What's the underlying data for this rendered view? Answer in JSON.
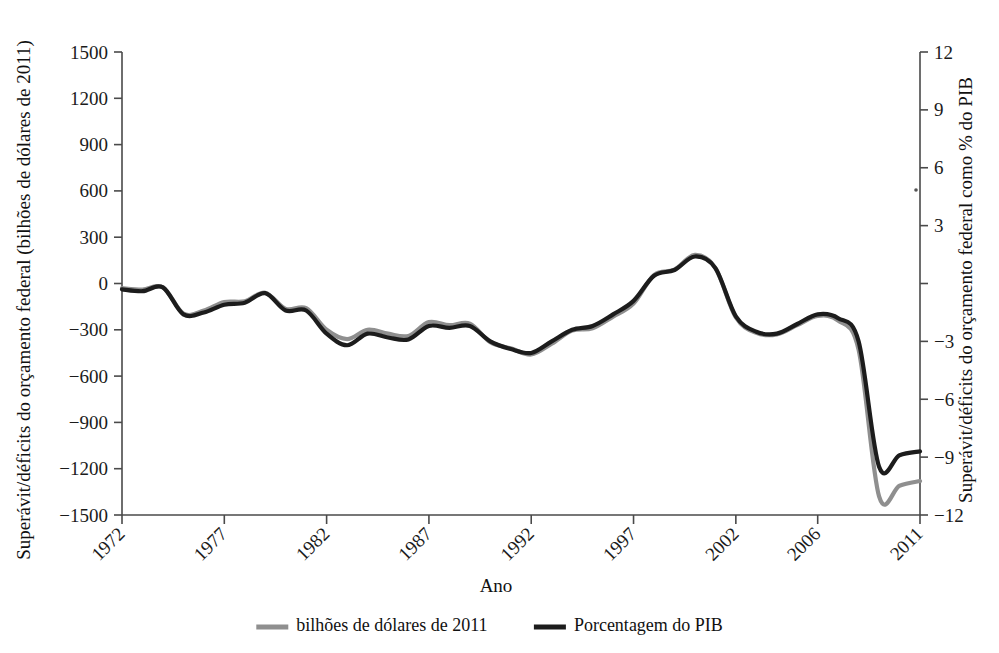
{
  "chart_data": {
    "type": "line",
    "title": "",
    "xlabel": "Ano",
    "ylabel_left": "Superávit/déficits do orçamento federal (bilhões de dólares de 2011)",
    "ylabel_right": "Superávit/déficits do orçamento federal como % do PIB",
    "xlim": [
      1972,
      2011
    ],
    "ylim_left": [
      -1500,
      1500
    ],
    "ylim_right": [
      -12,
      12
    ],
    "xticks": [
      1972,
      1977,
      1982,
      1987,
      1992,
      1997,
      2002,
      2006,
      2011
    ],
    "xticklabels": [
      "1972",
      "1977",
      "1982",
      "1987",
      "1992",
      "1997",
      "2002",
      "2006",
      "2011"
    ],
    "yticks_left": [
      1500,
      1200,
      900,
      600,
      300,
      0,
      -300,
      -600,
      -900,
      -1200,
      -1500
    ],
    "yticklabels_left": [
      "1500",
      "1200",
      "900",
      "600",
      "300",
      "0",
      "−300",
      "−600",
      "−900",
      "−1200",
      "−1500"
    ],
    "yticks_right": [
      12,
      9,
      6,
      3,
      0,
      -3,
      -6,
      -9,
      -12
    ],
    "yticklabels_right": [
      "12",
      "9",
      "6",
      "3",
      "",
      "−3",
      "−6",
      "−9",
      "−12"
    ],
    "grid": false,
    "legend_position": "bottom",
    "x": [
      1972,
      1973,
      1974,
      1975,
      1976,
      1977,
      1978,
      1979,
      1980,
      1981,
      1982,
      1983,
      1984,
      1985,
      1986,
      1987,
      1988,
      1989,
      1990,
      1991,
      1992,
      1993,
      1994,
      1995,
      1996,
      1997,
      1998,
      1999,
      2000,
      2001,
      2002,
      2003,
      2004,
      2005,
      2006,
      2007,
      2008,
      2009,
      2010,
      2011
    ],
    "series": [
      {
        "name": "bilhões de dólares de 2011",
        "axis": "left",
        "color": "#8f8f8f",
        "values": [
          -30,
          -40,
          -25,
          -195,
          -175,
          -120,
          -115,
          -60,
          -165,
          -160,
          -300,
          -360,
          -300,
          -325,
          -340,
          -250,
          -270,
          -260,
          -380,
          -420,
          -460,
          -390,
          -305,
          -290,
          -215,
          -130,
          55,
          90,
          185,
          100,
          -220,
          -320,
          -330,
          -270,
          -210,
          -240,
          -430,
          -1380,
          -1310,
          -1280
        ]
      },
      {
        "name": "Porcentagem do PIB",
        "axis": "right",
        "color": "#1c1c1c",
        "values": [
          -0.3,
          -0.4,
          -0.2,
          -1.6,
          -1.5,
          -1.1,
          -1.0,
          -0.5,
          -1.4,
          -1.4,
          -2.6,
          -3.2,
          -2.6,
          -2.8,
          -2.9,
          -2.2,
          -2.3,
          -2.2,
          -3.0,
          -3.4,
          -3.6,
          -3.0,
          -2.4,
          -2.2,
          -1.6,
          -0.9,
          0.4,
          0.7,
          1.4,
          0.8,
          -1.7,
          -2.5,
          -2.6,
          -2.1,
          -1.6,
          -1.8,
          -3.0,
          -9.5,
          -8.9,
          -8.7
        ]
      }
    ],
    "legend": [
      {
        "label": "bilhões de dólares de 2011",
        "color": "#8f8f8f"
      },
      {
        "label": "Porcentagem do PIB",
        "color": "#1c1c1c"
      }
    ]
  }
}
